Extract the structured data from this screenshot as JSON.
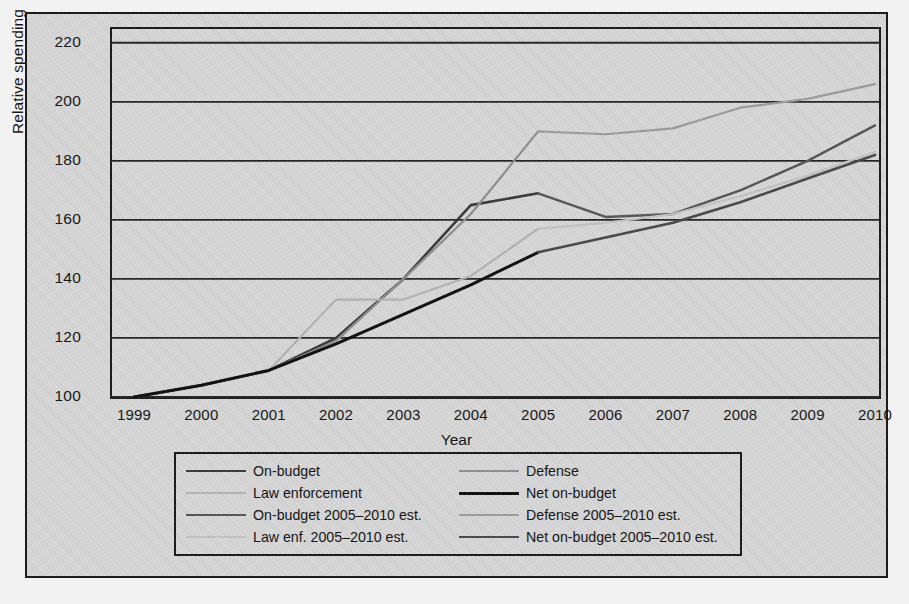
{
  "chart_data": {
    "type": "line",
    "title": "",
    "xlabel": "Year",
    "ylabel": "Relative spending",
    "x": [
      1999,
      2000,
      2001,
      2002,
      2003,
      2004,
      2005,
      2006,
      2007,
      2008,
      2009,
      2010
    ],
    "xlim": [
      1999,
      2010
    ],
    "ylim": [
      100,
      225
    ],
    "yticks": [
      100,
      120,
      140,
      160,
      180,
      200,
      220
    ],
    "xticks": [
      "1999",
      "2000",
      "2001",
      "2002",
      "2003",
      "2004",
      "2005",
      "2006",
      "2007",
      "2008",
      "2009",
      "2010"
    ],
    "grid": "horizontal",
    "legend_position": "below-plot",
    "series": [
      {
        "name": "On-budget",
        "color": "#3a3a3a",
        "width": 2.6,
        "x": [
          1999,
          2000,
          2001,
          2002,
          2003,
          2004,
          2005
        ],
        "values": [
          100,
          104,
          109,
          120,
          140,
          165,
          169
        ]
      },
      {
        "name": "Defense",
        "color": "#8f8f8f",
        "width": 2.2,
        "x": [
          1999,
          2000,
          2001,
          2002,
          2003,
          2004,
          2005
        ],
        "values": [
          100,
          104,
          109,
          119,
          140,
          162,
          190
        ]
      },
      {
        "name": "Law enforcement",
        "color": "#b4b4b4",
        "width": 2.2,
        "x": [
          1999,
          2000,
          2001,
          2002,
          2003,
          2004,
          2005
        ],
        "values": [
          100,
          104,
          109,
          133,
          133,
          141,
          157
        ]
      },
      {
        "name": "Net on-budget",
        "color": "#111111",
        "width": 3.0,
        "x": [
          1999,
          2000,
          2001,
          2002,
          2003,
          2004,
          2005
        ],
        "values": [
          100,
          104,
          109,
          118,
          128,
          138,
          149
        ]
      },
      {
        "name": "On-budget 2005–2010 est.",
        "color": "#575757",
        "width": 2.4,
        "x": [
          2005,
          2006,
          2007,
          2008,
          2009,
          2010
        ],
        "values": [
          169,
          161,
          162,
          170,
          180,
          192
        ]
      },
      {
        "name": "Defense 2005–2010 est.",
        "color": "#9d9d9d",
        "width": 2.2,
        "x": [
          2005,
          2006,
          2007,
          2008,
          2009,
          2010
        ],
        "values": [
          190,
          189,
          191,
          198,
          201,
          206
        ]
      },
      {
        "name": "Law enf. 2005–2010 est.",
        "color": "#c4c4c4",
        "width": 2.2,
        "x": [
          2005,
          2006,
          2007,
          2008,
          2009,
          2010
        ],
        "values": [
          157,
          159,
          162,
          168,
          175,
          183
        ]
      },
      {
        "name": "Net on-budget 2005–2010 est.",
        "color": "#4a4a4a",
        "width": 2.6,
        "x": [
          2005,
          2006,
          2007,
          2008,
          2009,
          2010
        ],
        "values": [
          149,
          154,
          159,
          166,
          174,
          182
        ]
      }
    ]
  },
  "legend": {
    "items": [
      {
        "label": "On-budget",
        "series": 0
      },
      {
        "label": "Defense",
        "series": 1
      },
      {
        "label": "Law enforcement",
        "series": 2
      },
      {
        "label": "Net on-budget",
        "series": 3
      },
      {
        "label": "On-budget 2005–2010 est.",
        "series": 4
      },
      {
        "label": "Defense 2005–2010 est.",
        "series": 5
      },
      {
        "label": "Law enf. 2005–2010 est.",
        "series": 6
      },
      {
        "label": "Net on-budget 2005–2010 est.",
        "series": 7
      }
    ]
  },
  "colors": {
    "panel_background": "#d7d7d7",
    "frame": "#1c1c1c",
    "gridline": "#262626",
    "text": "#161616"
  }
}
